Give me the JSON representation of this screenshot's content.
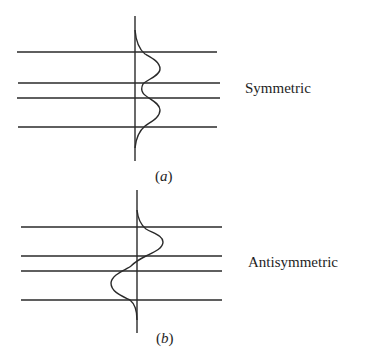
{
  "figure": {
    "panel_a": {
      "label": "Symmetric",
      "caption_open": "(",
      "caption_letter": "a",
      "caption_close": ")"
    },
    "panel_b": {
      "label": "Antisymmetric",
      "caption_open": "(",
      "caption_letter": "b",
      "caption_close": ")"
    },
    "colors": {
      "line": "#2a2a2a",
      "background": "#ffffff"
    }
  }
}
